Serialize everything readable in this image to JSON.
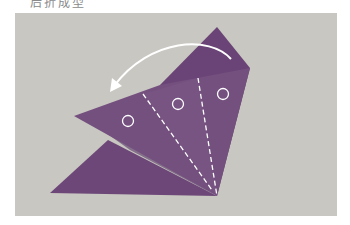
{
  "caption": {
    "text": "后折成型",
    "partially_visible": true
  },
  "photo": {
    "background_color": "#c9c7c1",
    "subject": "purple origami paper folding step",
    "paper_color": "#6f4a7a",
    "paper_shadow_color": "#5e3d69",
    "annotation_color": "#ffffff"
  },
  "annotations": {
    "fold_arrow": {
      "icon": "curved-arrow-left-icon",
      "direction": "counter-clockwise fold"
    },
    "dashed_fold_lines": 2,
    "circle_markers": 3
  }
}
